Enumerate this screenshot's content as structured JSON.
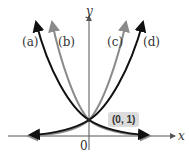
{
  "diagram": {
    "axes": {
      "x_label": "x",
      "y_label": "y",
      "origin_label": "0"
    },
    "curves": [
      {
        "label": "(a)",
        "color": "#111111"
      },
      {
        "label": "(b)",
        "color": "#8a8a8a"
      },
      {
        "label": "(c)",
        "color": "#8a8a8a"
      },
      {
        "label": "(d)",
        "color": "#111111"
      }
    ],
    "point": {
      "label": "(0, 1)"
    }
  }
}
